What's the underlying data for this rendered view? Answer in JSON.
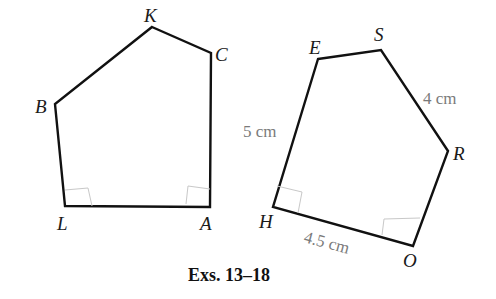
{
  "figure": {
    "caption": "Exs. 13–18",
    "polygon_left": {
      "name": "pentagon KCALB",
      "vertices": {
        "K": {
          "label": "K"
        },
        "C": {
          "label": "C"
        },
        "A": {
          "label": "A"
        },
        "L": {
          "label": "L"
        },
        "B": {
          "label": "B"
        }
      },
      "right_angles": [
        "L",
        "A"
      ]
    },
    "polygon_right": {
      "name": "pentagon ESROH",
      "vertices": {
        "E": {
          "label": "E"
        },
        "S": {
          "label": "S"
        },
        "R": {
          "label": "R"
        },
        "O": {
          "label": "O"
        },
        "H": {
          "label": "H"
        }
      },
      "measurements": {
        "EH": "5 cm",
        "SR": "4 cm",
        "HO": "4.5 cm"
      },
      "right_angles": [
        "H",
        "O"
      ]
    }
  }
}
